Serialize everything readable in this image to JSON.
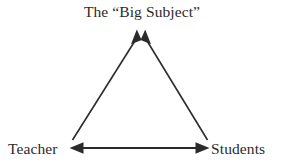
{
  "diagram": {
    "title_node": "The “Big Subject”",
    "left_node": "Teacher",
    "right_node": "Students",
    "stroke_color": "#2b2b2b",
    "background_color": "#ffffff",
    "stroke_width": 1.6,
    "nodes": [
      {
        "id": "big-subject",
        "label": "The “Big Subject”",
        "x": 141,
        "y": 18
      },
      {
        "id": "teacher",
        "label": "Teacher",
        "x": 38,
        "y": 148
      },
      {
        "id": "students",
        "label": "Students",
        "x": 245,
        "y": 148
      }
    ],
    "edges": [
      {
        "id": "teacher-to-big-subject",
        "from": "teacher",
        "to": "big-subject",
        "arrowheads": "end",
        "x1": 73,
        "y1": 140,
        "x2": 136,
        "y2": 32
      },
      {
        "id": "students-to-big-subject",
        "from": "students",
        "to": "big-subject",
        "arrowheads": "end",
        "x1": 207,
        "y1": 140,
        "x2": 146,
        "y2": 32
      },
      {
        "id": "teacher-students-bidirectional",
        "from": "teacher",
        "to": "students",
        "arrowheads": "both",
        "x1": 71,
        "y1": 148,
        "x2": 208,
        "y2": 148
      }
    ]
  }
}
